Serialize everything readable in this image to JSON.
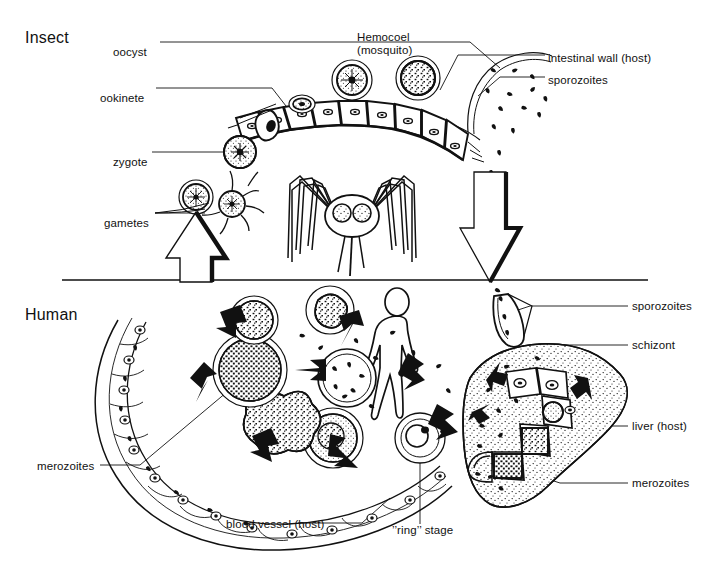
{
  "figure": {
    "title_hidden": "Malaria life cycle diagram",
    "ink_color": "#111111",
    "background_color": "#ffffff",
    "divider": {
      "y": 280,
      "x_start": 62,
      "x_end": 648
    }
  },
  "sections": [
    {
      "id": "insect",
      "label": "Insect",
      "x": 25,
      "y": 32
    },
    {
      "id": "human",
      "label": "Human",
      "x": 25,
      "y": 309
    }
  ],
  "labels": {
    "oocyst": {
      "text": "oocyst",
      "x": 113,
      "y": 46,
      "align": "left"
    },
    "ookinete": {
      "text": "ookinete",
      "x": 100,
      "y": 92,
      "align": "left"
    },
    "zygote": {
      "text": "zygote",
      "x": 113,
      "y": 156,
      "align": "left"
    },
    "gametes": {
      "text": "gametes",
      "x": 104,
      "y": 217,
      "align": "left"
    },
    "hemocoel_1": {
      "text": "Hemocoel",
      "x": 357,
      "y": 31,
      "align": "left"
    },
    "hemocoel_2": {
      "text": "(mosquito)",
      "x": 357,
      "y": 43,
      "align": "left"
    },
    "intestinal_wall": {
      "text": "intestinal wall (host)",
      "x": 548,
      "y": 59,
      "align": "left"
    },
    "sporozoites_top": {
      "text": "sporozoites",
      "x": 548,
      "y": 81,
      "align": "left"
    },
    "sporozoites_human": {
      "text": "sporozoites",
      "x": 632,
      "y": 310,
      "align": "left"
    },
    "schizont": {
      "text": "schizont",
      "x": 632,
      "y": 349,
      "align": "left"
    },
    "liver_host": {
      "text": "liver (host)",
      "x": 632,
      "y": 430,
      "align": "left"
    },
    "merozoites_liver": {
      "text": "merozoites",
      "x": 632,
      "y": 487,
      "align": "left"
    },
    "merozoites_blood": {
      "text": "merozoites",
      "x": 37,
      "y": 469,
      "align": "left"
    },
    "blood_vessel": {
      "text": "blood vessel (host)",
      "x": 226,
      "y": 527,
      "align": "left"
    },
    "ring_stage": {
      "text": "’’ring’’ stage",
      "x": 392,
      "y": 533,
      "align": "left"
    }
  },
  "leader_lines": {
    "oocyst": "M160,42 L470,42 L500,68",
    "ookinete": "M156,88 L272,88 L300,124",
    "zygote": "M152,152 L236,152",
    "gametes": "M155,213 L205,213",
    "hemocoel": "M355,56 L355,50",
    "intestinal_wall": "M545,55 L458,55 L440,90",
    "sporozoites_top": "M545,77 L500,77 L478,96",
    "sporozoites_human": "M628,306 L530,306 L512,312",
    "schizont": "M628,345 L556,345 L545,392",
    "liver_host": "M628,426 L586,426 L566,400",
    "merozoites_liver": "M628,483 L560,483 L520,470",
    "merozoites_blood": "M100,465 L140,465 L246,376",
    "blood_vessel": "M298,523 L362,523 L390,498",
    "ring_stage": "M420,524 L420,442"
  },
  "graphics": {
    "mosquito": {
      "cx": 352,
      "cy": 215,
      "name": "mosquito-figure"
    },
    "human_figure": {
      "cx": 398,
      "cy": 340,
      "name": "human-figure"
    },
    "liver": {
      "cx": 545,
      "cy": 440,
      "name": "liver-organ"
    },
    "blood_vessel_arc": {
      "cx": 270,
      "cy": 430,
      "name": "blood-vessel-arc"
    },
    "gut_epithelium": {
      "cx": 360,
      "cy": 115,
      "name": "insect-gut-epithelium"
    },
    "up_arrow": {
      "x": 196,
      "y": 225,
      "name": "transmission-up-arrow"
    },
    "down_arrow": {
      "x": 490,
      "y": 190,
      "name": "transmission-down-arrow"
    }
  }
}
